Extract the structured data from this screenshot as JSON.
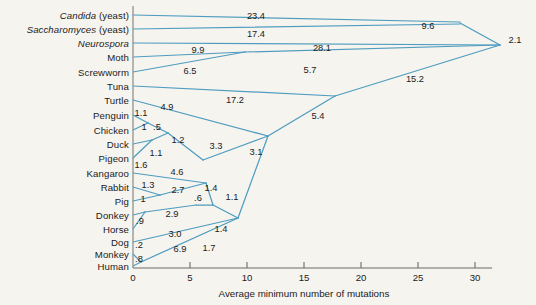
{
  "figure": {
    "background_color": "#f6f4ef",
    "line_color": "#4e9cbf",
    "axis_color": "#6b6b6b",
    "text_color": "#1b1b1b"
  },
  "axis": {
    "title": "Average minimum number of mutations",
    "ticks": [
      {
        "value": 0,
        "label": "0"
      },
      {
        "value": 5,
        "label": "5"
      },
      {
        "value": 10,
        "label": "10"
      },
      {
        "value": 15,
        "label": "15"
      },
      {
        "value": 20,
        "label": "20"
      },
      {
        "value": 25,
        "label": "25"
      },
      {
        "value": 30,
        "label": "30"
      }
    ],
    "range": [
      0,
      31.5
    ],
    "pixel_origin_x": 133,
    "pixel_per_unit": 11.4,
    "baseline_y": 268
  },
  "taxa": [
    {
      "name": "Candida (yeast)",
      "italic_part": "Candida",
      "plain_part": " (yeast)",
      "y": 15
    },
    {
      "name": "Saccharomyces (yeast)",
      "italic_part": "Saccharomyces",
      "plain_part": " (yeast)",
      "y": 29
    },
    {
      "name": "Neurospora",
      "italic_part": "Neurospora",
      "plain_part": "",
      "y": 43
    },
    {
      "name": "Moth",
      "italic_part": "",
      "plain_part": "Moth",
      "y": 57
    },
    {
      "name": "Screwworm",
      "italic_part": "",
      "plain_part": "Screwworm",
      "y": 72
    },
    {
      "name": "Tuna",
      "italic_part": "",
      "plain_part": "Tuna",
      "y": 86
    },
    {
      "name": "Turtle",
      "italic_part": "",
      "plain_part": "Turtle",
      "y": 100
    },
    {
      "name": "Penguin",
      "italic_part": "",
      "plain_part": "Penguin",
      "y": 115
    },
    {
      "name": "Chicken",
      "italic_part": "",
      "plain_part": "Chicken",
      "y": 130
    },
    {
      "name": "Duck",
      "italic_part": "",
      "plain_part": "Duck",
      "y": 144
    },
    {
      "name": "Pigeon",
      "italic_part": "",
      "plain_part": "Pigeon",
      "y": 158
    },
    {
      "name": "Kangaroo",
      "italic_part": "",
      "plain_part": "Kangaroo",
      "y": 173
    },
    {
      "name": "Rabbit",
      "italic_part": "",
      "plain_part": "Rabbit",
      "y": 187
    },
    {
      "name": "Pig",
      "italic_part": "",
      "plain_part": "Pig",
      "y": 201
    },
    {
      "name": "Donkey",
      "italic_part": "",
      "plain_part": "Donkey",
      "y": 215
    },
    {
      "name": "Horse",
      "italic_part": "",
      "plain_part": "Horse",
      "y": 229
    },
    {
      "name": "Dog",
      "italic_part": "",
      "plain_part": "Dog",
      "y": 242
    },
    {
      "name": "Monkey",
      "italic_part": "",
      "plain_part": "Monkey",
      "y": 254
    },
    {
      "name": "Human",
      "italic_part": "",
      "plain_part": "Human",
      "y": 266
    }
  ],
  "branch_labels": [
    {
      "text": "23.4",
      "x": 256,
      "y": 16
    },
    {
      "text": "9.6",
      "x": 428,
      "y": 26
    },
    {
      "text": "2.1",
      "x": 515,
      "y": 40
    },
    {
      "text": "17.4",
      "x": 256,
      "y": 34
    },
    {
      "text": "28.1",
      "x": 322,
      "y": 48
    },
    {
      "text": "9.9",
      "x": 198,
      "y": 50
    },
    {
      "text": "6.5",
      "x": 190,
      "y": 71
    },
    {
      "text": "5.7",
      "x": 310,
      "y": 70
    },
    {
      "text": "15.2",
      "x": 415,
      "y": 79
    },
    {
      "text": "17.2",
      "x": 235,
      "y": 100
    },
    {
      "text": "5.4",
      "x": 318,
      "y": 116
    },
    {
      "text": "4.9",
      "x": 167,
      "y": 107
    },
    {
      "text": "1.1",
      "x": 141,
      "y": 113
    },
    {
      "text": "1",
      "x": 144,
      "y": 127
    },
    {
      "text": ".5",
      "x": 157,
      "y": 127
    },
    {
      "text": "1.2",
      "x": 178,
      "y": 140
    },
    {
      "text": "3.3",
      "x": 216,
      "y": 146
    },
    {
      "text": "3.1",
      "x": 256,
      "y": 152
    },
    {
      "text": "1.1",
      "x": 156,
      "y": 153
    },
    {
      "text": "1.6",
      "x": 141,
      "y": 165
    },
    {
      "text": "4.6",
      "x": 177,
      "y": 172
    },
    {
      "text": "1.3",
      "x": 148,
      "y": 185
    },
    {
      "text": "2.7",
      "x": 178,
      "y": 190
    },
    {
      "text": "1.4",
      "x": 211,
      "y": 188
    },
    {
      "text": "1.1",
      "x": 232,
      "y": 197
    },
    {
      "text": "1",
      "x": 143,
      "y": 199
    },
    {
      "text": ".6",
      "x": 198,
      "y": 198
    },
    {
      "text": ".9",
      "x": 140,
      "y": 221
    },
    {
      "text": "2.9",
      "x": 172,
      "y": 214
    },
    {
      "text": "3.0",
      "x": 175,
      "y": 234
    },
    {
      "text": "1.4",
      "x": 221,
      "y": 229
    },
    {
      "text": ".2",
      "x": 139,
      "y": 245
    },
    {
      "text": "6.9",
      "x": 180,
      "y": 249
    },
    {
      "text": "1.7",
      "x": 209,
      "y": 248
    },
    {
      "text": ".8",
      "x": 139,
      "y": 259
    }
  ],
  "tree_edges": [
    {
      "from": "Candida",
      "path": "M133,15 L460,22"
    },
    {
      "from": "Saccharomyces",
      "path": "M133,29 L460,24"
    },
    {
      "from": "yeast-node",
      "path": "M460,23 L500,45"
    },
    {
      "from": "Neurospora",
      "path": "M133,43 L500,45"
    },
    {
      "from": "Moth",
      "path": "M133,57 L245,52"
    },
    {
      "from": "Screwworm",
      "path": "M133,72 L245,52"
    },
    {
      "from": "insect-node",
      "path": "M245,52 L500,45"
    },
    {
      "from": "Tuna",
      "path": "M133,86 L335,96"
    },
    {
      "from": "vert-node",
      "path": "M335,96 L500,45"
    },
    {
      "from": "amniote-node",
      "path": "M335,96 L268,136"
    },
    {
      "from": "Turtle",
      "path": "M133,100 L268,136"
    },
    {
      "from": "bird-node",
      "path": "M268,136 L203,160"
    },
    {
      "from": "Penguin",
      "path": "M133,115 L148,123"
    },
    {
      "from": "Chicken",
      "path": "M133,130 L148,123"
    },
    {
      "from": "pc-node",
      "path": "M148,123 L168,133"
    },
    {
      "from": "Duck",
      "path": "M133,144 L152,140"
    },
    {
      "from": "duck-node",
      "path": "M152,140 L168,133"
    },
    {
      "from": "Pigeon",
      "path": "M133,158 L152,140"
    },
    {
      "from": "birds-node",
      "path": "M168,133 L203,160"
    },
    {
      "from": "mammal-node",
      "path": "M268,136 L238,218"
    },
    {
      "from": "Kangaroo",
      "path": "M133,173 L206,183"
    },
    {
      "from": "kang-node",
      "path": "M206,183 L213,205"
    },
    {
      "from": "Rabbit",
      "path": "M133,187 L160,195"
    },
    {
      "from": "Pig",
      "path": "M133,201 L160,195"
    },
    {
      "from": "rp-node",
      "path": "M160,195 L206,183"
    },
    {
      "from": "Donkey",
      "path": "M133,215 L145,212"
    },
    {
      "from": "Horse",
      "path": "M133,229 L145,212"
    },
    {
      "from": "dh-node",
      "path": "M145,212 L196,205"
    },
    {
      "from": "ungulate-node",
      "path": "M196,205 L213,205"
    },
    {
      "from": "ung2-node",
      "path": "M213,205 L238,218"
    },
    {
      "from": "Dog",
      "path": "M133,242 L238,218"
    },
    {
      "from": "Monkey",
      "path": "M133,254 L141,262"
    },
    {
      "from": "Human",
      "path": "M133,266 L141,262"
    },
    {
      "from": "primate-node",
      "path": "M141,262 L238,218"
    }
  ]
}
